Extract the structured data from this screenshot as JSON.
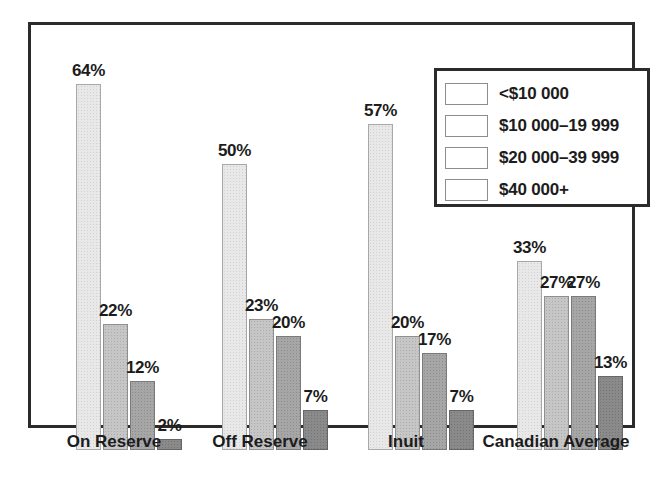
{
  "chart_data": {
    "type": "bar",
    "title": "",
    "xlabel": "",
    "ylabel": "",
    "ylim": [
      0,
      70
    ],
    "grid": false,
    "legend_position": "top-right",
    "value_suffix": "%",
    "categories": [
      "On Reserve",
      "Off Reserve",
      "Inuit",
      "Canadian Average"
    ],
    "series": [
      {
        "name": "<$10 000",
        "color": "#e8e8e8",
        "values": [
          64,
          50,
          57,
          33
        ]
      },
      {
        "name": "$10 000–19 999",
        "color": "#c6c6c6",
        "values": [
          22,
          23,
          20,
          27
        ]
      },
      {
        "name": "$20 000–39 999",
        "color": "#a6a6a6",
        "values": [
          12,
          20,
          17,
          27
        ]
      },
      {
        "name": "$40 000+",
        "color": "#8a8a8a",
        "values": [
          2,
          7,
          7,
          13
        ]
      }
    ],
    "value_labels": [
      [
        "64%",
        "22%",
        "12%",
        "2%"
      ],
      [
        "50%",
        "23%",
        "20%",
        "7%"
      ],
      [
        "57%",
        "20%",
        "17%",
        "7%"
      ],
      [
        "33%",
        "27%",
        "27%",
        "13%"
      ]
    ]
  },
  "legend": {
    "items": [
      {
        "label": "<$10 000"
      },
      {
        "label": "$10 000–19 999"
      },
      {
        "label": "$20 000–39 999"
      },
      {
        "label": "$40 000+"
      }
    ]
  },
  "axis": {
    "categories": [
      {
        "label": "On Reserve"
      },
      {
        "label": "Off Reserve"
      },
      {
        "label": "Inuit"
      },
      {
        "label": "Canadian Average"
      }
    ]
  },
  "colors": {
    "frame": "#2b2b2b",
    "text": "#1c1c1c",
    "background": "#ffffff"
  }
}
